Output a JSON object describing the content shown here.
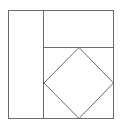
{
  "diagram": {
    "stroke_color": "#6a6a6a",
    "background": "#ffffff",
    "outer_square": {
      "x": 8,
      "y": 10,
      "width": 106,
      "height": 109
    },
    "vertical_divider": {
      "x": 43,
      "y1": 10,
      "y2": 119
    },
    "horizontal_divider": {
      "y": 47,
      "x1": 43,
      "x2": 114
    },
    "diamond": {
      "top": [
        79,
        47
      ],
      "right": [
        114,
        83
      ],
      "bottom": [
        79,
        119
      ],
      "left": [
        44,
        83
      ]
    }
  }
}
